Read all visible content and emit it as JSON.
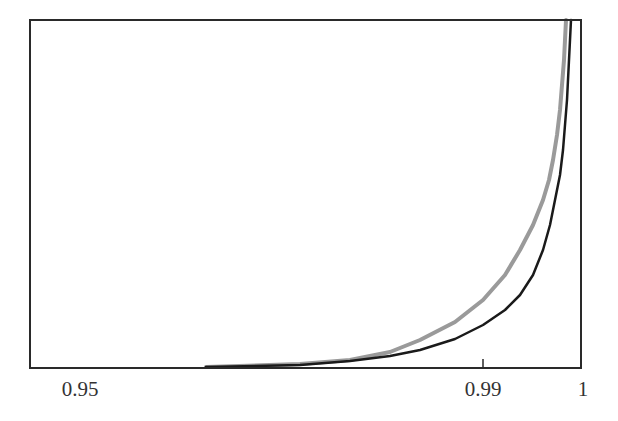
{
  "chart_data": {
    "type": "line",
    "title": "",
    "xlabel": "",
    "ylabel": "",
    "x_scale": "log(1-x) (non-linear, compresses toward 1)",
    "xlim": [
      0.943,
      1
    ],
    "x_ticks": [
      {
        "label": "0.95",
        "value": 0.95,
        "px": 80,
        "mark": false
      },
      {
        "label": "0.99",
        "value": 0.99,
        "px": 483,
        "mark": true
      },
      {
        "label": "1",
        "value": 1,
        "px": 583,
        "mark": false
      }
    ],
    "y_ticks": [],
    "grid": false,
    "legend": null,
    "series": [
      {
        "name": "gray curve",
        "color": "#9a9a9a",
        "stroke_width": 4,
        "points_px": [
          [
            206,
            367
          ],
          [
            300,
            364
          ],
          [
            350,
            360
          ],
          [
            390,
            352
          ],
          [
            420,
            340
          ],
          [
            455,
            322
          ],
          [
            483,
            300
          ],
          [
            505,
            275
          ],
          [
            520,
            250
          ],
          [
            533,
            225
          ],
          [
            543,
            200
          ],
          [
            549,
            180
          ],
          [
            553,
            160
          ],
          [
            557,
            135
          ],
          [
            560,
            110
          ],
          [
            562,
            85
          ],
          [
            564,
            60
          ],
          [
            565,
            40
          ],
          [
            566,
            20
          ]
        ]
      },
      {
        "name": "black curve",
        "color": "#1a1a1a",
        "stroke_width": 2.5,
        "points_px": [
          [
            206,
            367
          ],
          [
            300,
            365
          ],
          [
            350,
            361
          ],
          [
            390,
            356
          ],
          [
            420,
            350
          ],
          [
            455,
            339
          ],
          [
            483,
            325
          ],
          [
            505,
            310
          ],
          [
            520,
            295
          ],
          [
            533,
            275
          ],
          [
            543,
            250
          ],
          [
            550,
            225
          ],
          [
            555,
            200
          ],
          [
            560,
            175
          ],
          [
            563,
            150
          ],
          [
            565,
            125
          ],
          [
            567,
            100
          ],
          [
            568,
            80
          ],
          [
            569,
            60
          ],
          [
            570,
            40
          ],
          [
            571,
            20
          ]
        ]
      }
    ],
    "frame": {
      "left": 30,
      "top": 20,
      "right": 581,
      "bottom": 368,
      "color": "#2a2a2a"
    }
  }
}
